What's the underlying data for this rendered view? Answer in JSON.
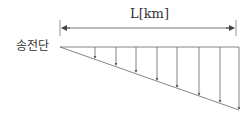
{
  "diagram": {
    "title": "",
    "length_label": "L[km]",
    "sending_end_label": "송전단",
    "line_color": "#555555",
    "arrow_count": 8,
    "load_arrows": [
      {
        "x": 95,
        "y_end": 58
      },
      {
        "x": 116,
        "y_end": 65
      },
      {
        "x": 136,
        "y_end": 72
      },
      {
        "x": 157,
        "y_end": 80
      },
      {
        "x": 177,
        "y_end": 87
      },
      {
        "x": 199,
        "y_end": 95
      },
      {
        "x": 220,
        "y_end": 102
      },
      {
        "x": 239,
        "y_end": 109
      }
    ]
  }
}
